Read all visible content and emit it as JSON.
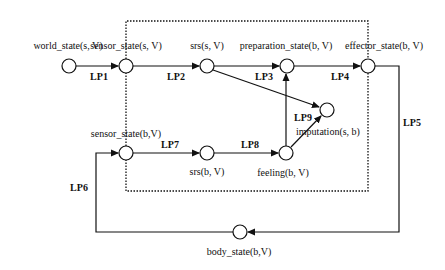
{
  "diagram": {
    "nodes": [
      {
        "id": "world_state",
        "label": "world_state(s, V)"
      },
      {
        "id": "sensor_state_s",
        "label": "sensor_state(s, V)"
      },
      {
        "id": "srs_s",
        "label": "srs(s, V)"
      },
      {
        "id": "preparation_state",
        "label": "preparation_state(b, V)"
      },
      {
        "id": "effector_state",
        "label": "effector_state(b, V)"
      },
      {
        "id": "imputation",
        "label": "imputation(s, b)"
      },
      {
        "id": "sensor_state_b",
        "label": "sensor_state(b,V)"
      },
      {
        "id": "srs_b",
        "label": "srs(b, V)"
      },
      {
        "id": "feeling",
        "label": "feeling(b, V)"
      },
      {
        "id": "body_state",
        "label": "body_state(b,V)"
      }
    ],
    "edges": [
      {
        "id": "LP1",
        "label": "LP1",
        "from": "world_state",
        "to": "sensor_state_s"
      },
      {
        "id": "LP2",
        "label": "LP2",
        "from": "sensor_state_s",
        "to": "srs_s"
      },
      {
        "id": "LP3",
        "label": "LP3",
        "from": "srs_s",
        "to": "preparation_state"
      },
      {
        "id": "LP4",
        "label": "LP4",
        "from": "preparation_state",
        "to": "effector_state"
      },
      {
        "id": "LP5",
        "label": "LP5",
        "from": "effector_state",
        "to": "body_state"
      },
      {
        "id": "LP6",
        "label": "LP6",
        "from": "body_state",
        "to": "sensor_state_b"
      },
      {
        "id": "LP7",
        "label": "LP7",
        "from": "sensor_state_b",
        "to": "srs_b"
      },
      {
        "id": "LP8",
        "label": "LP8",
        "from": "srs_b",
        "to": "feeling"
      },
      {
        "id": "LP9",
        "label": "LP9",
        "from": "feeling",
        "to": "imputation"
      }
    ]
  }
}
